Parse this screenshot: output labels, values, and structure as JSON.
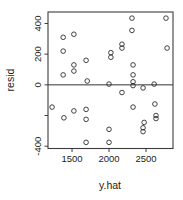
{
  "figure": {
    "background": "#ffffff",
    "frame_color": "#3c3c3c",
    "point_color": "#2e2e2e",
    "zero_line_color": "#333333"
  },
  "chart_data": {
    "type": "scatter",
    "title": "",
    "xlabel": "y.hat",
    "ylabel": "resid",
    "marker": "open-circle",
    "grid": false,
    "legend": false,
    "zero_line_y": 0,
    "xlim": [
      1175,
      2865
    ],
    "ylim": [
      -415,
      475
    ],
    "x_ticks": [
      {
        "value": 1500,
        "label": "1500"
      },
      {
        "value": 2000,
        "label": "2000"
      },
      {
        "value": 2500,
        "label": "2500"
      }
    ],
    "y_ticks": [
      {
        "value": 400,
        "label": "400"
      },
      {
        "value": 200,
        "label": "200"
      },
      {
        "value": 0,
        "label": "0"
      },
      {
        "value": -200,
        "label": ""
      },
      {
        "value": -400,
        "label": "-400"
      }
    ],
    "points": [
      [
        2310,
        435
      ],
      [
        2770,
        435
      ],
      [
        2310,
        355
      ],
      [
        1525,
        330
      ],
      [
        1380,
        310
      ],
      [
        2175,
        265
      ],
      [
        2175,
        240
      ],
      [
        2785,
        240
      ],
      [
        1380,
        220
      ],
      [
        2025,
        210
      ],
      [
        2025,
        180
      ],
      [
        1690,
        160
      ],
      [
        1525,
        130
      ],
      [
        2325,
        130
      ],
      [
        1525,
        90
      ],
      [
        1380,
        65
      ],
      [
        2325,
        65
      ],
      [
        1705,
        25
      ],
      [
        2000,
        5
      ],
      [
        2610,
        5
      ],
      [
        2325,
        20
      ],
      [
        2325,
        -5
      ],
      [
        2460,
        -20
      ],
      [
        2175,
        -50
      ],
      [
        2620,
        -125
      ],
      [
        2325,
        -145
      ],
      [
        1230,
        -145
      ],
      [
        1690,
        -160
      ],
      [
        1525,
        -170
      ],
      [
        2635,
        -200
      ],
      [
        2635,
        -220
      ],
      [
        1390,
        -215
      ],
      [
        1690,
        -225
      ],
      [
        2475,
        -245
      ],
      [
        2460,
        -280
      ],
      [
        2460,
        -305
      ],
      [
        2000,
        -290
      ],
      [
        1690,
        -375
      ],
      [
        2000,
        -375
      ]
    ]
  }
}
